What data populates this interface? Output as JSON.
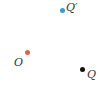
{
  "diagram": {
    "points": [
      {
        "id": "Q_prime",
        "label": "Q′",
        "color": "#3a9ad9",
        "x": 62,
        "y": 10,
        "label_x": 66,
        "label_y": 2
      },
      {
        "id": "O",
        "label": "O",
        "color": "#d9674e",
        "x": 27,
        "y": 52,
        "label_x": 14,
        "label_y": 57
      },
      {
        "id": "Q",
        "label": "Q",
        "color": "#111111",
        "x": 82,
        "y": 69,
        "label_x": 87,
        "label_y": 69
      }
    ]
  }
}
